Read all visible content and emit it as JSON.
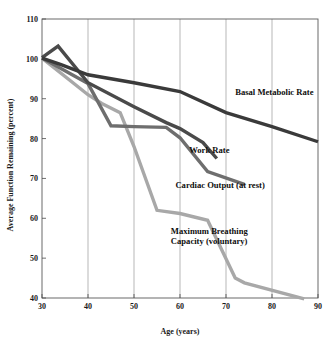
{
  "chart_data": {
    "type": "line",
    "title": "",
    "xlabel": "Age (years)",
    "ylabel": "Average Function Remaining (percent)",
    "xlim": [
      30,
      90
    ],
    "ylim": [
      40,
      110
    ],
    "xticks": [
      30,
      40,
      50,
      60,
      70,
      80,
      90
    ],
    "yticks": [
      40,
      50,
      60,
      70,
      80,
      90,
      100,
      110
    ],
    "grid": "vertical-only",
    "legend_position": "inline-annotations",
    "series": [
      {
        "name": "Basal Metabolic Rate",
        "color": "#3a3a3a",
        "label_x": 72,
        "label_y": 91,
        "points": [
          [
            30,
            100.2
          ],
          [
            34,
            98.6
          ],
          [
            40,
            96.0
          ],
          [
            50,
            94.0
          ],
          [
            60,
            91.8
          ],
          [
            70,
            86.5
          ],
          [
            80,
            83.0
          ],
          [
            90,
            79.2
          ]
        ]
      },
      {
        "name": "Work Rate",
        "color": "#4a4a4a",
        "label_x": 62,
        "label_y": 76.5,
        "points": [
          [
            30,
            100.3
          ],
          [
            33.5,
            103.2
          ],
          [
            40,
            94.0
          ],
          [
            50,
            88.0
          ],
          [
            57,
            84.0
          ],
          [
            60,
            82.5
          ],
          [
            65,
            79.0
          ],
          [
            68,
            75.0
          ]
        ]
      },
      {
        "name": "Cardiac Output (at rest)",
        "color": "#6e6e6e",
        "label_x": 59,
        "label_y": 67.5,
        "points": [
          [
            30,
            100.2
          ],
          [
            40,
            93.8
          ],
          [
            45,
            83.2
          ],
          [
            50,
            83.0
          ],
          [
            57,
            82.8
          ],
          [
            60,
            80.2
          ],
          [
            66,
            71.7
          ],
          [
            74,
            68.5
          ]
        ]
      },
      {
        "name": "Maximum Breathing Capacity (voluntary)",
        "color": "#a8a8a8",
        "label_x": 58,
        "label_y": 56.0,
        "points": [
          [
            30,
            100.2
          ],
          [
            40,
            91.0
          ],
          [
            43,
            88.8
          ],
          [
            47,
            86.5
          ],
          [
            50,
            78.0
          ],
          [
            55,
            62.0
          ],
          [
            60,
            61.2
          ],
          [
            66,
            59.5
          ],
          [
            72,
            45.0
          ],
          [
            74,
            43.8
          ],
          [
            87,
            39.8
          ]
        ]
      }
    ],
    "series_labels": [
      "Basal Metabolic Rate",
      "Work Rate",
      "Cardiac Output (at rest)",
      "Maximum Breathing",
      "Capacity (voluntary)"
    ]
  }
}
